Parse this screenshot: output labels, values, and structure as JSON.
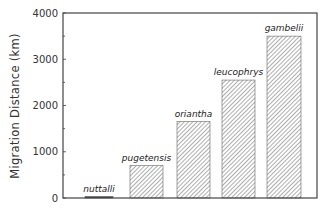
{
  "chart_data": {
    "type": "bar",
    "title": "",
    "xlabel": "",
    "ylabel": "Migration Distance (km)",
    "ylim": [
      0,
      4000
    ],
    "yticks": [
      0,
      1000,
      2000,
      3000,
      4000
    ],
    "ytick_labels": [
      "0",
      "1000",
      "2000",
      "3000",
      "4000"
    ],
    "minor_tick_step": 500,
    "grid": false,
    "legend": null,
    "categories": [
      "nuttalli",
      "pugetensis",
      "oriantha",
      "leucophrys",
      "gambelii"
    ],
    "values": [
      15,
      700,
      1650,
      2550,
      3500
    ],
    "bar_fill": "diagonal hatch",
    "annotations": "category labels in italics above each bar"
  },
  "colors": {
    "axis": "#444444",
    "hatch": "#777777",
    "bar_outline": "#666666",
    "text": "#333333"
  }
}
